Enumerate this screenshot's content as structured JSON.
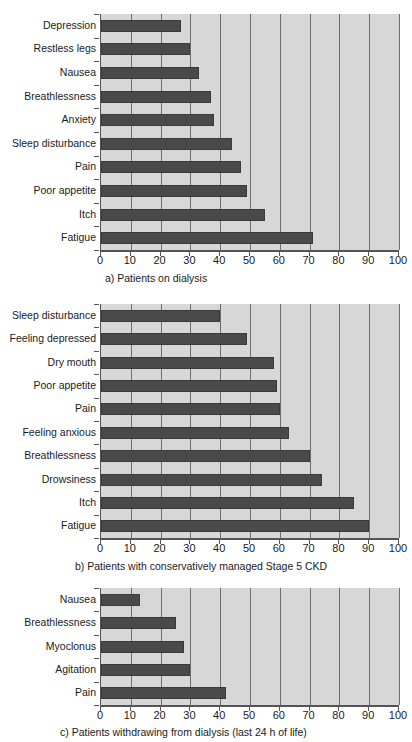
{
  "figure": {
    "panels": [
      {
        "id": "panel-a",
        "caption": "a) Patients on dialysis",
        "chart_data": {
          "type": "bar",
          "orientation": "horizontal",
          "title": "a) Patients on dialysis",
          "xlabel": "",
          "ylabel": "",
          "xlim": [
            0,
            100
          ],
          "xticks": [
            0,
            10,
            20,
            30,
            40,
            50,
            60,
            70,
            80,
            90,
            100
          ],
          "grid": true,
          "legend": "none",
          "categories": [
            "Depression",
            "Restless legs",
            "Nausea",
            "Breathlessness",
            "Anxiety",
            "Sleep disturbance",
            "Pain",
            "Poor appetite",
            "Itch",
            "Fatigue"
          ],
          "values": [
            27,
            30,
            33,
            37,
            38,
            44,
            47,
            49,
            55,
            71
          ]
        }
      },
      {
        "id": "panel-b",
        "caption": "b) Patients with conservatively managed Stage 5 CKD",
        "chart_data": {
          "type": "bar",
          "orientation": "horizontal",
          "title": "b) Patients with conservatively managed Stage 5 CKD",
          "xlabel": "",
          "ylabel": "",
          "xlim": [
            0,
            100
          ],
          "xticks": [
            0,
            10,
            20,
            30,
            40,
            50,
            60,
            70,
            80,
            90,
            100
          ],
          "grid": true,
          "legend": "none",
          "categories": [
            "Sleep disturbance",
            "Feeling depressed",
            "Dry mouth",
            "Poor appetite",
            "Pain",
            "Feeling anxious",
            "Breathlessness",
            "Drowsiness",
            "Itch",
            "Fatigue"
          ],
          "values": [
            40,
            49,
            58,
            59,
            60,
            63,
            70,
            74,
            85,
            90
          ]
        }
      },
      {
        "id": "panel-c",
        "caption": "c) Patients withdrawing from dialysis (last 24 h of life)",
        "chart_data": {
          "type": "bar",
          "orientation": "horizontal",
          "title": "c) Patients withdrawing from dialysis (last 24 h of life)",
          "xlabel": "",
          "ylabel": "",
          "xlim": [
            0,
            100
          ],
          "xticks": [
            0,
            10,
            20,
            30,
            40,
            50,
            60,
            70,
            80,
            90,
            100
          ],
          "grid": true,
          "legend": "none",
          "categories": [
            "Nausea",
            "Breathlessness",
            "Myoclonus",
            "Agitation",
            "Pain"
          ],
          "values": [
            13,
            25,
            28,
            30,
            42
          ]
        }
      }
    ],
    "colors": {
      "bar_fill": "#4a4a4a",
      "plot_background": "#d7d7d7",
      "gridline": "#6e6e6e",
      "axis": "#555555",
      "text": "#1a1a1a",
      "page_background": "#ffffff"
    }
  },
  "chart_data": [
    {
      "type": "bar",
      "orientation": "horizontal",
      "title": "a) Patients on dialysis",
      "xlabel": "",
      "ylabel": "",
      "xlim": [
        0,
        100
      ],
      "xticks": [
        0,
        10,
        20,
        30,
        40,
        50,
        60,
        70,
        80,
        90,
        100
      ],
      "grid": true,
      "legend": "none",
      "categories": [
        "Depression",
        "Restless legs",
        "Nausea",
        "Breathlessness",
        "Anxiety",
        "Sleep disturbance",
        "Pain",
        "Poor appetite",
        "Itch",
        "Fatigue"
      ],
      "values": [
        27,
        30,
        33,
        37,
        38,
        44,
        47,
        49,
        55,
        71
      ]
    },
    {
      "type": "bar",
      "orientation": "horizontal",
      "title": "b) Patients with conservatively managed Stage 5 CKD",
      "xlabel": "",
      "ylabel": "",
      "xlim": [
        0,
        100
      ],
      "xticks": [
        0,
        10,
        20,
        30,
        40,
        50,
        60,
        70,
        80,
        90,
        100
      ],
      "grid": true,
      "legend": "none",
      "categories": [
        "Sleep disturbance",
        "Feeling depressed",
        "Dry mouth",
        "Poor appetite",
        "Pain",
        "Feeling anxious",
        "Breathlessness",
        "Drowsiness",
        "Itch",
        "Fatigue"
      ],
      "values": [
        40,
        49,
        58,
        59,
        60,
        63,
        70,
        74,
        85,
        90
      ]
    },
    {
      "type": "bar",
      "orientation": "horizontal",
      "title": "c) Patients withdrawing from dialysis (last 24 h of life)",
      "xlabel": "",
      "ylabel": "",
      "xlim": [
        0,
        100
      ],
      "xticks": [
        0,
        10,
        20,
        30,
        40,
        50,
        60,
        70,
        80,
        90,
        100
      ],
      "grid": true,
      "legend": "none",
      "categories": [
        "Nausea",
        "Breathlessness",
        "Myoclonus",
        "Agitation",
        "Pain"
      ],
      "values": [
        13,
        25,
        28,
        30,
        42
      ]
    }
  ]
}
